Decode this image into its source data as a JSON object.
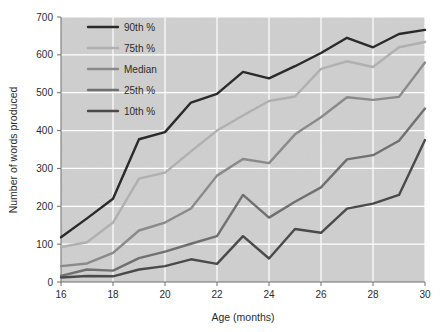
{
  "figure": {
    "background_color": "#ffffff",
    "plot_background_color": "#cfcfcf",
    "gridline_color": "#ffffff",
    "axis_color": "#6e6e6e"
  },
  "chart_data": {
    "type": "line",
    "title": "",
    "xlabel": "Age (months)",
    "ylabel": "Number of words produced",
    "xlim": [
      16,
      30
    ],
    "ylim": [
      0,
      700
    ],
    "xticks": [
      16,
      18,
      20,
      22,
      24,
      26,
      28,
      30
    ],
    "yticks": [
      0,
      100,
      200,
      300,
      400,
      500,
      600,
      700
    ],
    "xtick_labels": [
      "16",
      "18",
      "20",
      "22",
      "24",
      "26",
      "28",
      "30"
    ],
    "ytick_labels": [
      "0",
      "100",
      "200",
      "300",
      "400",
      "500",
      "600",
      "700"
    ],
    "grid": true,
    "legend_position": "upper-left",
    "x": [
      16,
      17,
      18,
      19,
      20,
      21,
      22,
      23,
      24,
      25,
      26,
      27,
      28,
      29,
      30
    ],
    "series": [
      {
        "name": "90th %",
        "color": "#2a2a2a",
        "values": [
          118,
          168,
          220,
          377,
          396,
          474,
          497,
          555,
          538,
          570,
          605,
          645,
          620,
          655,
          666
        ]
      },
      {
        "name": "75th %",
        "color": "#b0b0b0",
        "values": [
          92,
          105,
          157,
          273,
          289,
          345,
          400,
          440,
          478,
          490,
          563,
          583,
          568,
          620,
          634
        ]
      },
      {
        "name": "Median",
        "color": "#8a8a8a",
        "values": [
          42,
          49,
          77,
          136,
          157,
          194,
          281,
          325,
          314,
          390,
          435,
          488,
          481,
          489,
          580
        ]
      },
      {
        "name": "25th %",
        "color": "#707070",
        "values": [
          16,
          33,
          30,
          63,
          80,
          101,
          121,
          230,
          170,
          212,
          250,
          324,
          335,
          373,
          458
        ]
      },
      {
        "name": "10th %",
        "color": "#4a4a4a",
        "values": [
          12,
          16,
          15,
          33,
          42,
          60,
          48,
          121,
          62,
          140,
          130,
          194,
          207,
          230,
          375
        ]
      }
    ],
    "legend_entries": [
      {
        "label": "90th %",
        "color": "#2a2a2a"
      },
      {
        "label": "75th %",
        "color": "#b0b0b0"
      },
      {
        "label": "Median",
        "color": "#8a8a8a"
      },
      {
        "label": "25th %",
        "color": "#707070"
      },
      {
        "label": "10th %",
        "color": "#4a4a4a"
      }
    ]
  }
}
